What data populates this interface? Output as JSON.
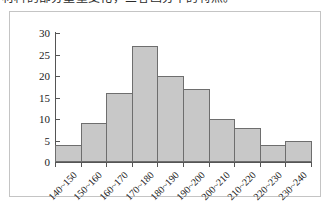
{
  "caption": {
    "text": "材料的部分重量变化，三者画分率的特点。"
  },
  "chart_data": {
    "type": "bar",
    "title": "",
    "xlabel": "",
    "ylabel": "",
    "categories": [
      "140~150",
      "150~160",
      "160~170",
      "170~180",
      "180~190",
      "190~200",
      "200~210",
      "210~220",
      "220~230",
      "230~240"
    ],
    "values": [
      4,
      9,
      16,
      27,
      20,
      17,
      10,
      8,
      4,
      5
    ],
    "ylim": [
      0,
      30
    ],
    "yticks": [
      0,
      5,
      10,
      15,
      20,
      25,
      30
    ],
    "ytick_labels": [
      "0",
      "5",
      "10",
      "15",
      "20",
      "25",
      "30"
    ],
    "grid": false,
    "legend": false,
    "bar_fill_color": "#c8c8c8",
    "bar_border_color": "#6e6e6e",
    "axis_color": "#555555",
    "frame_color": "#c4c4c4"
  }
}
